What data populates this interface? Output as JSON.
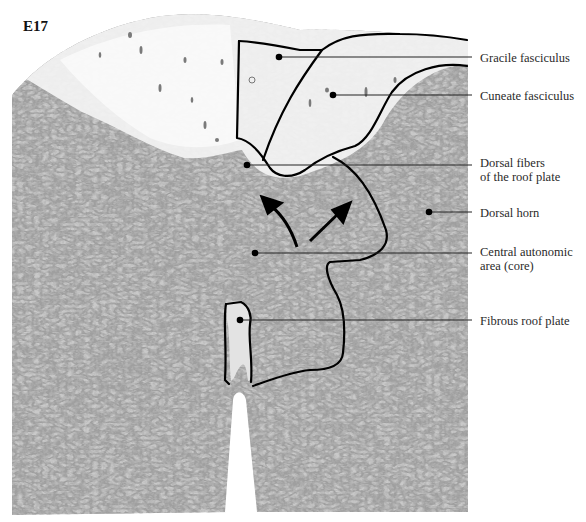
{
  "figure": {
    "stage_label": "E17",
    "labels": [
      {
        "id": "gracile",
        "text": "Gracile fasciculus",
        "top": 51,
        "dot": [
          279,
          57
        ],
        "line_y": 57
      },
      {
        "id": "cuneate",
        "text": "Cuneate fasciculus",
        "top": 89,
        "dot": [
          333,
          95
        ],
        "line_y": 95
      },
      {
        "id": "dorsal-fibers",
        "text": "Dorsal fibers\nof the roof plate",
        "top": 156,
        "dot": [
          247,
          165
        ],
        "line_y": 165
      },
      {
        "id": "dorsal-horn",
        "text": "Dorsal horn",
        "top": 206,
        "dot": [
          429,
          212
        ],
        "line_y": 212
      },
      {
        "id": "central-autonomic",
        "text": "Central autonomic\narea (core)",
        "top": 245,
        "dot": [
          255,
          253
        ],
        "line_y": 253
      },
      {
        "id": "fibrous-roof-plate",
        "text": "Fibrous roof plate",
        "top": 314,
        "dot": [
          240,
          320
        ],
        "line_y": 320
      }
    ],
    "colors": {
      "tissue_dark": "#6e6e6e",
      "tissue_mid": "#a9a9a9",
      "tissue_light": "#d6d6d6",
      "white_matter": "#f2f2f2",
      "outline": "#000000",
      "label_text": "#2a2a2a"
    }
  }
}
